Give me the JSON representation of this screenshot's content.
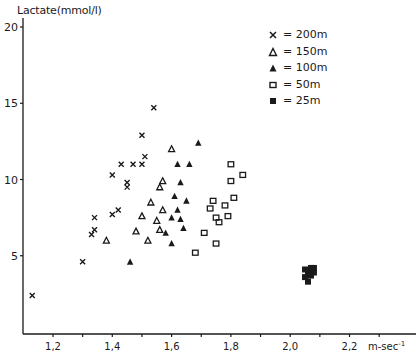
{
  "chart_data": {
    "type": "scatter",
    "title": "",
    "xlabel": "m-sec⁻¹",
    "ylabel": "Lactate(mmol/l)",
    "xlim": [
      1.1,
      2.37
    ],
    "ylim": [
      0,
      21
    ],
    "x_ticks": [
      1.2,
      1.3,
      1.4,
      1.5,
      1.6,
      1.7,
      1.8,
      1.9,
      2.0,
      2.1,
      2.2,
      2.3
    ],
    "x_tick_labels": [
      "1,2",
      "1,4",
      "1,6",
      "1,8",
      "2,0",
      "2,2"
    ],
    "x_labeled_ticks": [
      1.2,
      1.4,
      1.6,
      1.8,
      2.0,
      2.2
    ],
    "y_ticks": [
      5,
      10,
      15,
      20
    ],
    "y_tick_labels": [
      "5",
      "10",
      "15",
      "20"
    ],
    "grid": false,
    "legend_position": "upper right",
    "series": [
      {
        "name": "200m",
        "legend": "x = 200m",
        "marker": "x",
        "points": [
          [
            1.13,
            2.4
          ],
          [
            1.3,
            4.6
          ],
          [
            1.33,
            6.4
          ],
          [
            1.34,
            6.7
          ],
          [
            1.34,
            7.5
          ],
          [
            1.4,
            7.7
          ],
          [
            1.42,
            8.0
          ],
          [
            1.4,
            10.3
          ],
          [
            1.43,
            11.0
          ],
          [
            1.45,
            9.5
          ],
          [
            1.45,
            9.8
          ],
          [
            1.47,
            11.0
          ],
          [
            1.5,
            11.0
          ],
          [
            1.51,
            11.5
          ],
          [
            1.5,
            12.9
          ],
          [
            1.54,
            14.7
          ]
        ]
      },
      {
        "name": "150m",
        "legend": "Δ = 150m",
        "marker": "triangle-open",
        "points": [
          [
            1.38,
            6.0
          ],
          [
            1.48,
            6.6
          ],
          [
            1.5,
            7.6
          ],
          [
            1.52,
            6.0
          ],
          [
            1.53,
            8.5
          ],
          [
            1.55,
            7.3
          ],
          [
            1.56,
            6.7
          ],
          [
            1.56,
            9.5
          ],
          [
            1.57,
            9.9
          ],
          [
            1.57,
            8.0
          ],
          [
            1.6,
            12.0
          ]
        ]
      },
      {
        "name": "100m",
        "legend": "▲ = 100m",
        "marker": "triangle-filled",
        "points": [
          [
            1.46,
            4.6
          ],
          [
            1.58,
            6.5
          ],
          [
            1.6,
            5.8
          ],
          [
            1.6,
            7.5
          ],
          [
            1.61,
            8.9
          ],
          [
            1.62,
            8.0
          ],
          [
            1.62,
            11.0
          ],
          [
            1.63,
            7.4
          ],
          [
            1.63,
            9.8
          ],
          [
            1.64,
            6.8
          ],
          [
            1.65,
            8.6
          ],
          [
            1.66,
            11.0
          ],
          [
            1.69,
            12.4
          ]
        ]
      },
      {
        "name": "50m",
        "legend": "□ = 50m",
        "marker": "square-open",
        "points": [
          [
            1.68,
            5.2
          ],
          [
            1.71,
            6.5
          ],
          [
            1.73,
            8.1
          ],
          [
            1.74,
            8.6
          ],
          [
            1.75,
            5.8
          ],
          [
            1.75,
            7.5
          ],
          [
            1.76,
            7.2
          ],
          [
            1.78,
            8.3
          ],
          [
            1.79,
            7.6
          ],
          [
            1.8,
            9.9
          ],
          [
            1.8,
            11.0
          ],
          [
            1.81,
            8.8
          ],
          [
            1.84,
            10.3
          ]
        ]
      },
      {
        "name": "25m",
        "legend": "■ = 25m",
        "marker": "square-filled",
        "points": [
          [
            2.05,
            3.6
          ],
          [
            2.05,
            4.1
          ],
          [
            2.06,
            3.3
          ],
          [
            2.06,
            3.9
          ],
          [
            2.07,
            4.2
          ],
          [
            2.07,
            3.7
          ],
          [
            2.08,
            3.9
          ],
          [
            2.08,
            4.2
          ]
        ]
      }
    ]
  },
  "axes": {
    "ylabel": "Lactate(mmol/l)",
    "xlabel": "m-sec",
    "xlabel_sup": "-1"
  },
  "legend": {
    "items": [
      {
        "label": "= 200m"
      },
      {
        "label": "= 150m"
      },
      {
        "label": "= 100m"
      },
      {
        "label": "= 50m"
      },
      {
        "label": "= 25m"
      }
    ]
  }
}
